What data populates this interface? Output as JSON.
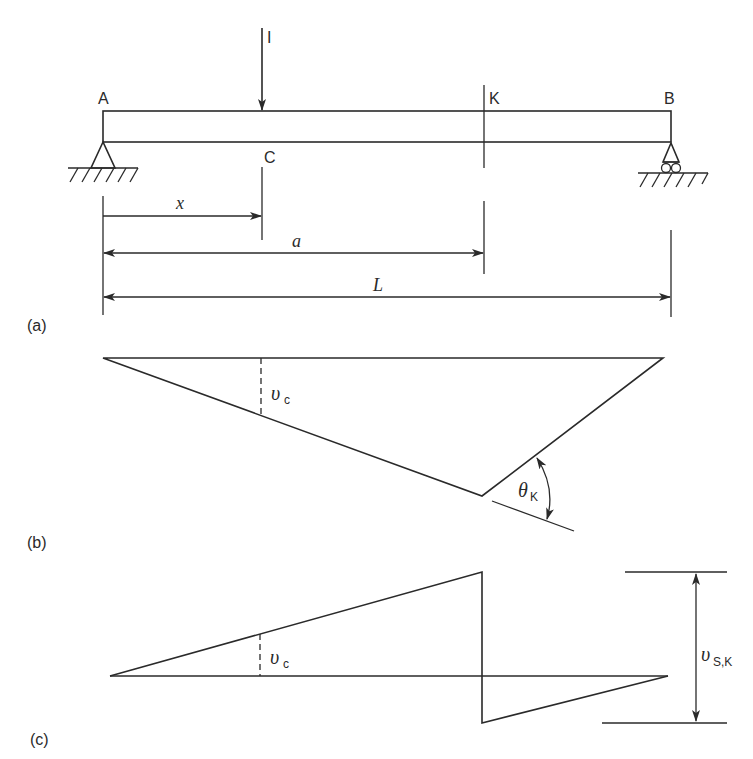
{
  "diagram": {
    "panels": [
      {
        "id": "a",
        "label": "(a)",
        "description": "Simply supported beam AB with unit load at C and section K"
      },
      {
        "id": "b",
        "label": "(b)",
        "description": "Influence line for bending moment at K"
      },
      {
        "id": "c",
        "label": "(c)",
        "description": "Influence line for shear force at K"
      }
    ],
    "beam": {
      "point_labels": {
        "A": "A",
        "B": "B",
        "C": "C",
        "K": "K"
      },
      "load_label": "I",
      "supports": {
        "left": "pin",
        "right": "roller"
      }
    },
    "dimensions": {
      "x": "x",
      "a": "a",
      "L": "L"
    },
    "moment_line": {
      "ordinate_label": "υ",
      "ordinate_sub": "c",
      "angle_label": "θ",
      "angle_sub": "K"
    },
    "shear_line": {
      "ordinate_label": "υ",
      "ordinate_sub": "c",
      "jump_label": "υ",
      "jump_sub": "S,K"
    },
    "colors": {
      "ink": "#2a2a2a",
      "background": "#ffffff"
    }
  }
}
